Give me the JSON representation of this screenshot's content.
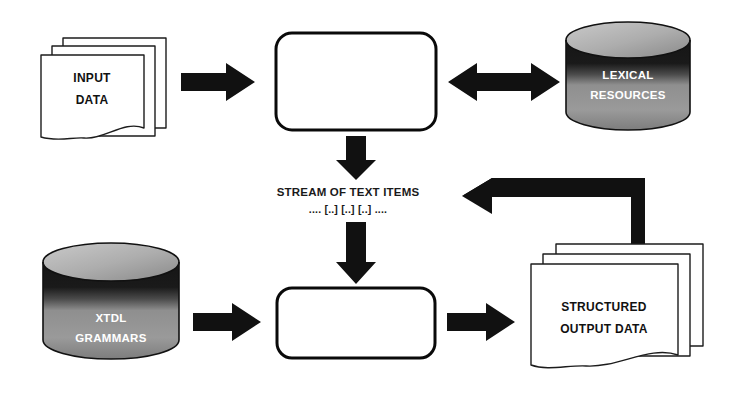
{
  "diagram": {
    "background_color": "#ffffff",
    "nodes": [
      {
        "id": "input-data",
        "shape": "paper-stack",
        "label_lines": [
          "INPUT",
          "DATA"
        ],
        "text_color": "#111111",
        "fill_color": "#ffffff",
        "stroke_color": "#1c1c1c"
      },
      {
        "id": "linguistic-processing-resources",
        "shape": "rounded-box",
        "label_lines": [
          "LINGUISTIC",
          "PROCESSING",
          "RESOURCES"
        ],
        "text_color": "#ffffff",
        "fill_color": "#6b6b6b",
        "stroke_color": "#0a0a0a"
      },
      {
        "id": "lexical-resources",
        "shape": "cylinder",
        "label_lines": [
          "LEXICAL",
          "RESOURCES"
        ],
        "text_color": "#ffffff",
        "fill_color": "#8c8c8c",
        "stroke_color": "#111111"
      },
      {
        "id": "stream-of-text-items",
        "shape": "text",
        "label_lines": [
          "STREAM OF TEXT ITEMS",
          ".... [..] [..] [..] ...."
        ],
        "text_color": "#1a1a1a"
      },
      {
        "id": "xtdl-grammars",
        "shape": "cylinder",
        "label_lines": [
          "XTDL",
          "GRAMMARS"
        ],
        "text_color": "#ffffff",
        "fill_color": "#8c8c8c",
        "stroke_color": "#111111"
      },
      {
        "id": "xtdl-interpreter",
        "shape": "rounded-box",
        "label_lines": [
          "XTDL",
          "INTERPRETER"
        ],
        "text_color": "#ffffff",
        "fill_color": "#6b6b6b",
        "stroke_color": "#0a0a0a"
      },
      {
        "id": "structured-output-data",
        "shape": "paper-stack",
        "label_lines": [
          "STRUCTURED",
          "OUTPUT DATA"
        ],
        "text_color": "#111111",
        "fill_color": "#ffffff",
        "stroke_color": "#1c1c1c"
      }
    ],
    "connectors": [
      {
        "id": "input-to-lpr",
        "from": "input-data",
        "to": "linguistic-processing-resources",
        "direction": "right",
        "style": "block-arrow"
      },
      {
        "id": "lpr-to-lexical",
        "from": "linguistic-processing-resources",
        "to": "lexical-resources",
        "direction": "bidirectional",
        "style": "block-arrow"
      },
      {
        "id": "lpr-to-stream",
        "from": "linguistic-processing-resources",
        "to": "stream-of-text-items",
        "direction": "down",
        "style": "block-arrow"
      },
      {
        "id": "stream-to-interpreter",
        "from": "stream-of-text-items",
        "to": "xtdl-interpreter",
        "direction": "down",
        "style": "block-arrow"
      },
      {
        "id": "grammars-to-interpreter",
        "from": "xtdl-grammars",
        "to": "xtdl-interpreter",
        "direction": "right",
        "style": "block-arrow"
      },
      {
        "id": "interpreter-to-output",
        "from": "xtdl-interpreter",
        "to": "structured-output-data",
        "direction": "right",
        "style": "block-arrow"
      },
      {
        "id": "output-feedback-to-stream",
        "from": "structured-output-data",
        "to": "stream-of-text-items",
        "direction": "left-elbow",
        "style": "block-arrow"
      }
    ]
  }
}
